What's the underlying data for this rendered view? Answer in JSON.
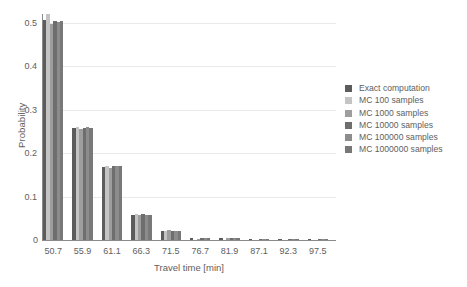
{
  "chart_data": {
    "type": "bar",
    "title": "",
    "subtitle": "",
    "xlabel": "Travel time [min]",
    "ylabel": "Probability",
    "categories": [
      "50.7",
      "55.9",
      "61.1",
      "66.3",
      "71.5",
      "76.7",
      "81.9",
      "87.1",
      "92.3",
      "97.5"
    ],
    "xlim": [
      48.1,
      100.1
    ],
    "ylim": [
      0,
      0.52
    ],
    "yticks": [
      "0",
      "0.1",
      "0.2",
      "0.3",
      "0.4",
      "0.5"
    ],
    "ytick_values": [
      0,
      0.1,
      0.2,
      0.3,
      0.4,
      0.5
    ],
    "grid": "horizontal",
    "legend_position": "right",
    "legend_frame": false,
    "series": [
      {
        "name": "Exact computation",
        "color": "#5c5c5c",
        "values": [
          0.506,
          0.257,
          0.169,
          0.058,
          0.021,
          0.0035,
          0.0045,
          0.0008,
          0.0004,
          0.0002
        ]
      },
      {
        "name": "MC 100 samples",
        "color": "#c4c4c4",
        "values": [
          0.52,
          0.26,
          0.17,
          0.06,
          0.02,
          0.0,
          0.0,
          0.0,
          0.0,
          0.0
        ]
      },
      {
        "name": "MC 1000 samples",
        "color": "#9e9e9e",
        "values": [
          0.498,
          0.255,
          0.165,
          0.057,
          0.022,
          0.003,
          0.005,
          0.0,
          0.0,
          0.0
        ]
      },
      {
        "name": "MC 10000 samples",
        "color": "#6e6e6e",
        "values": [
          0.503,
          0.258,
          0.17,
          0.059,
          0.021,
          0.0035,
          0.0045,
          0.0008,
          0.0003,
          0.0001
        ]
      },
      {
        "name": "MC 100000 samples",
        "color": "#8c8c8c",
        "values": [
          0.501,
          0.259,
          0.171,
          0.058,
          0.0215,
          0.0035,
          0.0045,
          0.0008,
          0.0004,
          0.0002
        ]
      },
      {
        "name": "MC 1000000 samples",
        "color": "#787878",
        "values": [
          0.504,
          0.258,
          0.1695,
          0.0585,
          0.0212,
          0.0035,
          0.0046,
          0.0008,
          0.0004,
          0.0002
        ]
      }
    ]
  }
}
